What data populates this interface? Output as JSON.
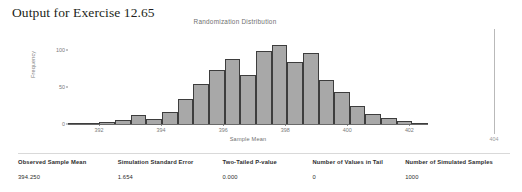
{
  "page": {
    "heading": "Output for Exercise 12.65"
  },
  "chart_data": {
    "type": "bar",
    "title": "Randomization Distribution",
    "xlabel": "Sample Mean",
    "ylabel": "Frequency",
    "xlim": [
      391.0,
      402.6
    ],
    "ylim": [
      0,
      125
    ],
    "grid": false,
    "legend": null,
    "xticks": [
      "392",
      "394",
      "396",
      "398",
      "400",
      "402"
    ],
    "xtick_values": [
      392,
      394,
      396,
      398,
      400,
      402
    ],
    "yticks": [
      "0",
      "50",
      "100"
    ],
    "ytick_values": [
      0,
      50,
      100
    ],
    "bin_width": 0.5,
    "bin_starts": [
      391.0,
      391.5,
      392.0,
      392.5,
      393.0,
      393.5,
      394.0,
      394.5,
      395.0,
      395.5,
      396.0,
      396.5,
      397.0,
      397.5,
      398.0,
      398.5,
      399.0,
      399.5,
      400.0,
      400.5,
      401.0,
      401.5,
      402.0
    ],
    "categories": [
      "391.0",
      "391.5",
      "392.0",
      "392.5",
      "393.0",
      "393.5",
      "394.0",
      "394.5",
      "395.0",
      "395.5",
      "396.0",
      "396.5",
      "397.0",
      "397.5",
      "398.0",
      "398.5",
      "399.0",
      "399.5",
      "400.0",
      "400.5",
      "401.0",
      "401.5",
      "402.0"
    ],
    "values": [
      2,
      1,
      3,
      5,
      12,
      7,
      16,
      34,
      55,
      74,
      88,
      66,
      99,
      107,
      84,
      97,
      60,
      44,
      25,
      14,
      8,
      4,
      2
    ]
  },
  "right_marker": {
    "label": "404"
  },
  "results": {
    "headers": [
      "Observed Sample Mean",
      "Simulation Standard Error",
      "Two-Tailed P-value",
      "Number of Values in Tail",
      "Number of Simulated Samples"
    ],
    "values": [
      "394.250",
      "1.654",
      "0.000",
      "0",
      "1000"
    ]
  }
}
